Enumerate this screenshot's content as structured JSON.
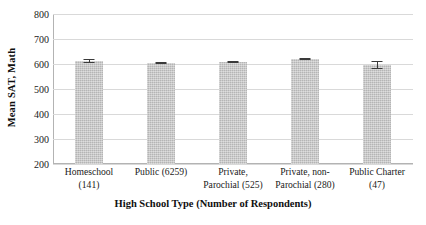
{
  "chart_data": {
    "type": "bar",
    "title": "",
    "xlabel": "High School Type (Number of Respondents)",
    "ylabel": "Mean SAT, Math",
    "categories": [
      "Homeschool (141)",
      "Public (6259)",
      "Private, Parochial (525)",
      "Private, non-Parochial (280)",
      "Public Charter (47)"
    ],
    "category_lines": [
      [
        "Homeschool",
        "(141)"
      ],
      [
        "Public (6259)",
        ""
      ],
      [
        "Private,",
        "Parochial (525)"
      ],
      [
        "Private, non-",
        "Parochial (280)"
      ],
      [
        "Public Charter",
        "(47)"
      ]
    ],
    "values": [
      613,
      605,
      608,
      620,
      597
    ],
    "errors": [
      7,
      2,
      4,
      5,
      15
    ],
    "ylim": [
      200,
      800
    ],
    "yticks": [
      200,
      300,
      400,
      500,
      600,
      700,
      800
    ],
    "ytick_labels": [
      "200",
      "300",
      "400",
      "500",
      "600",
      "700",
      "800"
    ],
    "grid": true,
    "legend": "none",
    "bar_color": "#c3c3c3",
    "error_color": "#3a3a3a",
    "gridline_color": "#d9d9d9",
    "axis_color": "#b3b3b3"
  }
}
